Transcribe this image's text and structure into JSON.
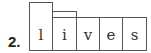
{
  "exercise": {
    "number": "2.",
    "word": "lives",
    "letters": [
      {
        "char": "l",
        "shape": "tall"
      },
      {
        "char": "i",
        "shape": "medium"
      },
      {
        "char": "v",
        "shape": "short"
      },
      {
        "char": "e",
        "shape": "short"
      },
      {
        "char": "s",
        "shape": "short"
      }
    ]
  }
}
